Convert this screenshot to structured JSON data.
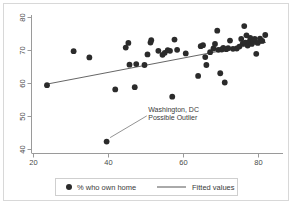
{
  "chart_data": {
    "type": "scatter",
    "title": "",
    "xlabel": "",
    "ylabel": "",
    "xlim": [
      20,
      82
    ],
    "ylim": [
      38.5,
      81
    ],
    "grid": false,
    "xticks": [
      20,
      40,
      60,
      80
    ],
    "yticks": [
      40,
      50,
      60,
      70,
      80
    ],
    "legend_position": "bottom-center",
    "legend": [
      {
        "label": "% who own home",
        "marker": "filled-circle",
        "color": "#2b2b2b"
      },
      {
        "label": "Fitted values",
        "marker": "line",
        "color": "#555555"
      }
    ],
    "series": [
      {
        "name": "% who own home",
        "marker": "filled-circle",
        "color": "#2b2b2b",
        "points": [
          [
            23.6,
            59.5
          ],
          [
            30.7,
            69.8
          ],
          [
            34.9,
            67.9
          ],
          [
            39.5,
            42.4
          ],
          [
            41.8,
            58.2
          ],
          [
            44.6,
            70.9
          ],
          [
            45.3,
            72.3
          ],
          [
            45.6,
            65.7
          ],
          [
            47.0,
            58.9
          ],
          [
            47.4,
            65.9
          ],
          [
            49.6,
            65.6
          ],
          [
            50.4,
            68.8
          ],
          [
            51.2,
            72.4
          ],
          [
            51.4,
            73.1
          ],
          [
            53.3,
            69.9
          ],
          [
            54.4,
            68.7
          ],
          [
            55.0,
            69.3
          ],
          [
            55.8,
            70.1
          ],
          [
            56.4,
            69.9
          ],
          [
            57.0,
            56.0
          ],
          [
            57.6,
            73.3
          ],
          [
            58.3,
            70.2
          ],
          [
            60.6,
            69.1
          ],
          [
            63.9,
            62.3
          ],
          [
            64.6,
            71.3
          ],
          [
            65.2,
            71.6
          ],
          [
            65.8,
            68.0
          ],
          [
            66.1,
            65.6
          ],
          [
            67.1,
            69.5
          ],
          [
            68.0,
            70.6
          ],
          [
            68.4,
            72.0
          ],
          [
            69.0,
            76.0
          ],
          [
            69.3,
            70.2
          ],
          [
            69.8,
            63.1
          ],
          [
            70.2,
            70.3
          ],
          [
            70.6,
            70.8
          ],
          [
            71.0,
            60.3
          ],
          [
            71.4,
            70.4
          ],
          [
            71.9,
            70.7
          ],
          [
            72.4,
            73.0
          ],
          [
            73.2,
            70.5
          ],
          [
            74.2,
            70.6
          ],
          [
            74.9,
            71.2
          ],
          [
            75.4,
            73.5
          ],
          [
            75.8,
            72.1
          ],
          [
            76.2,
            77.4
          ],
          [
            76.5,
            72.4
          ],
          [
            76.8,
            74.6
          ],
          [
            77.1,
            71.5
          ],
          [
            77.5,
            72.6
          ],
          [
            77.8,
            73.8
          ],
          [
            78.2,
            72.0
          ],
          [
            78.6,
            72.8
          ],
          [
            79.0,
            73.5
          ],
          [
            79.4,
            69.0
          ],
          [
            79.8,
            72.3
          ],
          [
            80.4,
            73.6
          ],
          [
            81.0,
            72.9
          ],
          [
            81.8,
            74.7
          ]
        ]
      }
    ],
    "fit_line": {
      "name": "Fitted values",
      "color": "#555555",
      "x": [
        23.5,
        82.0
      ],
      "y": [
        59.8,
        72.5
      ]
    },
    "annotations": [
      {
        "text_line1": "Washington, DC",
        "text_line2": "Possible Outlier",
        "text_x": 50.6,
        "text_y": 51.4,
        "target_x": 39.9,
        "target_y": 43.0
      }
    ]
  }
}
